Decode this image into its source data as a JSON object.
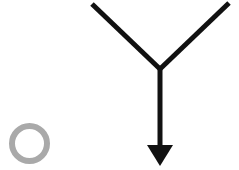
{
  "canvas": {
    "width": 239,
    "height": 170,
    "background_color": "#FFFFFF",
    "title": "Y-shaped arrow diagram with gray ring"
  },
  "shapes": {
    "ring": {
      "name": "gray-ring",
      "type": "circle-outline",
      "center_x": 29.5,
      "center_y": 143.5,
      "radius": 17.5,
      "stroke_width": 6,
      "stroke_color": "#A9A9A9",
      "fill": "none"
    },
    "arrow": {
      "name": "y-arrow",
      "type": "y-shaped-arrow",
      "stroke_color": "#111111",
      "stroke_width": 5,
      "vertex_x": 160,
      "vertex_y": 69,
      "left_branch_x": 92,
      "left_branch_y": 4,
      "right_branch_x": 229,
      "right_branch_y": 3,
      "shaft_end_x": 160,
      "shaft_end_y": 148,
      "arrowhead": {
        "name": "arrowhead-down",
        "tip_x": 160,
        "tip_y": 166,
        "left_x": 147,
        "right_x": 173,
        "base_y": 145,
        "fill_color": "#111111",
        "direction": "down"
      }
    }
  }
}
